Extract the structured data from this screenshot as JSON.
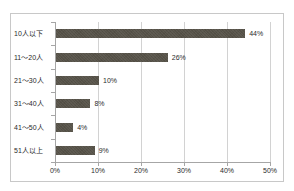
{
  "chart_data": {
    "type": "bar",
    "orientation": "horizontal",
    "title": "",
    "subtitle": "",
    "xlabel": "",
    "ylabel": "",
    "categories": [
      "10人以下",
      "11～20人",
      "21～30人",
      "31～40人",
      "41～50人",
      "51人以上"
    ],
    "values": [
      44,
      26,
      10,
      8,
      4,
      9
    ],
    "value_labels": [
      "44%",
      "26%",
      "10%",
      "8%",
      "4%",
      "9%"
    ],
    "xlim": [
      0,
      50
    ],
    "xticks": [
      0,
      10,
      20,
      30,
      40,
      50
    ],
    "xtick_labels": [
      "0%",
      "10%",
      "20%",
      "30%",
      "40%",
      "50%"
    ],
    "grid": true,
    "grid_axis": "x",
    "legend": false,
    "legend_position": "none",
    "colors": {
      "bar": "#565248",
      "gridline": "#d2d2d2",
      "axis": "#a6a6a6",
      "frame": "#c8c8c8",
      "background": "#ffffff",
      "text": "#2b2b2b"
    }
  }
}
